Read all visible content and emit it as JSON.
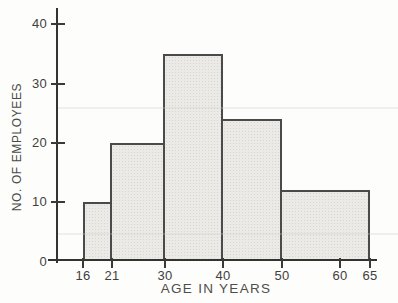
{
  "chart_data": {
    "type": "bar",
    "subtype": "histogram",
    "xlabel": "AGE IN YEARS",
    "ylabel": "NO. OF EMPLOYEES",
    "bins": [
      {
        "range": "16-21",
        "from": 16,
        "to": 21,
        "count": 10
      },
      {
        "range": "21-30",
        "from": 21,
        "to": 30,
        "count": 20
      },
      {
        "range": "30-40",
        "from": 30,
        "to": 40,
        "count": 35
      },
      {
        "range": "40-50",
        "from": 40,
        "to": 50,
        "count": 24
      },
      {
        "range": "50-65",
        "from": 50,
        "to": 65,
        "count": 12
      }
    ],
    "x_tick_values": [
      16,
      21,
      30,
      40,
      50,
      60,
      65
    ],
    "y_tick_values": [
      0,
      10,
      20,
      30,
      40
    ],
    "xlim": [
      16,
      65
    ],
    "ylim": [
      0,
      40
    ],
    "grid": false,
    "legend": null,
    "title": ""
  },
  "style": {
    "bar_fill": "#eceae6",
    "bar_border": "#4a4a4a",
    "axis_color": "#333330",
    "label_color": "#3f3f3d",
    "background": "#fdfdfb"
  }
}
